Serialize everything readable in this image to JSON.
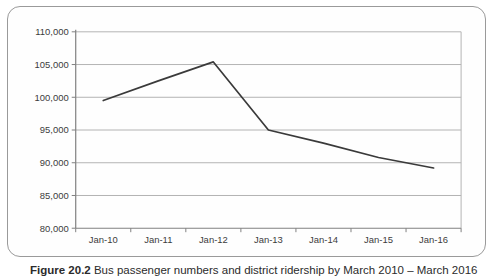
{
  "figure": {
    "caption_label": "Figure 20.2",
    "caption_text": " Bus passenger numbers and district ridership by March 2010 – March 2016"
  },
  "chart_data": {
    "type": "line",
    "title": "",
    "xlabel": "",
    "ylabel": "",
    "categories": [
      "Jan-10",
      "Jan-11",
      "Jan-12",
      "Jan-13",
      "Jan-14",
      "Jan-15",
      "Jan-16"
    ],
    "values": [
      99500,
      102500,
      105400,
      95000,
      93000,
      90800,
      89200
    ],
    "ylim": [
      80000,
      110000
    ],
    "ytick_step": 5000,
    "ytick_labels": [
      "80,000",
      "85,000",
      "90,000",
      "95,000",
      "100,000",
      "105,000",
      "110,000"
    ],
    "grid": true,
    "legend_position": "none",
    "colors": {
      "line": "#3a3a3a",
      "gridline": "#b3b3b3",
      "plot_border": "#b3b3b3",
      "axis": "#808080",
      "tick": "#808080",
      "label": "#3c3c3c",
      "frame_border": "#9a9a9a",
      "background": "#ffffff"
    }
  }
}
